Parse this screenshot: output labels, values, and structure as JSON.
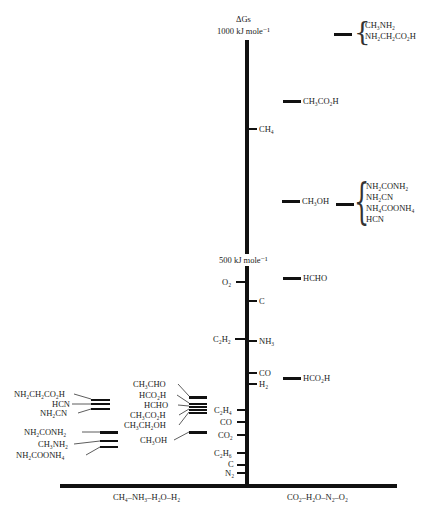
{
  "axis": {
    "title": "ΔGs",
    "top_label": "1000 kJ mole⁻¹",
    "mid_label": "500 kJ mole⁻¹",
    "bottom_left_label": "CH₄–NH₃–H₂O–H₂",
    "bottom_right_label": "CO₂–H₂O–N₂–O₂"
  },
  "right_levels": [
    {
      "id": "r1000",
      "group": [
        "CH₃NH₂",
        "NH₂CH₂CO₂H"
      ]
    },
    {
      "id": "acetic",
      "label": "CH₃CO₂H"
    },
    {
      "id": "methanol",
      "label": "CH₃OH",
      "group": [
        "NH₂CONH₂",
        "NH₂CN",
        "NH₄COONH₄",
        "HCN"
      ]
    },
    {
      "id": "hcho",
      "label": "HCHO"
    },
    {
      "id": "hco2h",
      "label": "HCO₂H"
    }
  ],
  "axis_ticks": [
    {
      "label": "CH₄",
      "side": "right"
    },
    {
      "label": "O₂",
      "side": "left"
    },
    {
      "label": "C",
      "side": "right"
    },
    {
      "label": "C₂H₂",
      "side": "left"
    },
    {
      "label": "NH₃",
      "side": "right"
    },
    {
      "label": "CO",
      "side": "right"
    },
    {
      "label": "H₂",
      "side": "right"
    },
    {
      "label": "C₂H₄",
      "side": "left"
    },
    {
      "label": "CO",
      "side": "left"
    },
    {
      "label": "CO₂",
      "side": "left"
    },
    {
      "label": "C₂H₆",
      "side": "left"
    },
    {
      "label": "C",
      "side": "left"
    },
    {
      "label": "N₂",
      "side": "left"
    }
  ],
  "left_group_a": [
    "CH₃CHO",
    "HCO₂H",
    "HCHO",
    "CH₃CO₂H",
    "CH₃CH₂OH",
    "CH₃OH"
  ],
  "left_group_b": [
    "NH₂CH₂CO₂H",
    "HCN",
    "NH₂CN",
    "NH₂CONH₂",
    "CH₃NH₂",
    "NH₂COONH₄"
  ]
}
